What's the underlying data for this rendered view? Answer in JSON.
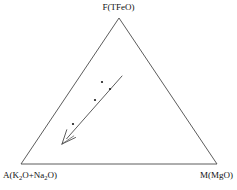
{
  "figure": {
    "type": "ternary-diagram",
    "background_color": "#ffffff",
    "line_color": "#4a4a4a",
    "text_color": "#111111"
  },
  "labels": {
    "apex": "F(TFeO)",
    "bottom_left_prefix": "A(K",
    "bottom_left_sub1": "2",
    "bottom_left_mid": "O+Na",
    "bottom_left_sub2": "2",
    "bottom_left_suffix": "O)",
    "bottom_left_full": "A(K2O+Na2O)",
    "bottom_right": "M(MgO)"
  },
  "chart_data": {
    "type": "scatter",
    "title": "",
    "subtitle": "",
    "xlabel": "",
    "ylabel": "",
    "grid": false,
    "legend": null,
    "axes": {
      "kind": "ternary",
      "corners": [
        {
          "name": "F",
          "label": "F(TFeO)",
          "component": "TFeO",
          "pixel": [
            119,
            18
          ]
        },
        {
          "name": "A",
          "label": "A(K2O+Na2O)",
          "component": "K2O+Na2O",
          "pixel": [
            21,
            164
          ]
        },
        {
          "name": "M",
          "label": "M(MgO)",
          "component": "MgO",
          "pixel": [
            217,
            164
          ]
        }
      ]
    },
    "series": [
      {
        "name": "samples",
        "marker": "dot",
        "marker_color": "#1a1a1a",
        "marker_size_px": 2.2,
        "points_pixel": [
          [
            73,
            124
          ],
          [
            95,
            100
          ],
          [
            102,
            82
          ],
          [
            110,
            89
          ]
        ],
        "points_ternary": [
          {
            "A": 0.52,
            "F": 0.27,
            "M": 0.21
          },
          {
            "A": 0.41,
            "F": 0.44,
            "M": 0.15
          },
          {
            "A": 0.34,
            "F": 0.56,
            "M": 0.1
          },
          {
            "A": 0.33,
            "F": 0.51,
            "M": 0.16
          }
        ]
      }
    ],
    "annotations": [
      {
        "kind": "trend-arrow",
        "label": "",
        "from_pixel": [
          122,
          76
        ],
        "to_pixel": [
          62,
          144
        ],
        "arrowhead": "at-end",
        "direction": "toward-A-corner",
        "color": "#4a4a4a"
      }
    ]
  }
}
